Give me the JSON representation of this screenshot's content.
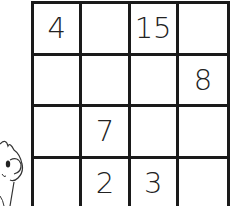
{
  "puzzle": {
    "type": "4x4 number grid",
    "rows": [
      [
        "4",
        "",
        "15",
        ""
      ],
      [
        "",
        "",
        "",
        "8"
      ],
      [
        "",
        "7",
        "",
        ""
      ],
      [
        "",
        "2",
        "3",
        ""
      ]
    ]
  },
  "illustration": {
    "icon": "cartoon-character-icon",
    "description": "partial cartoon creature peeking from left edge"
  },
  "colors": {
    "line": "#1a1a1a",
    "background": "#ffffff",
    "text": "#222222"
  }
}
